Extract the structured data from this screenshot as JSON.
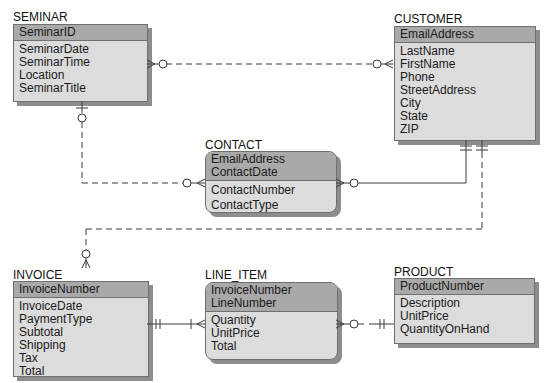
{
  "diagram": {
    "type": "entity-relationship (crow's foot, IE notation)",
    "entities": [
      {
        "name": "SEMINAR",
        "keys": [
          "SeminarID"
        ],
        "attributes": [
          "SeminarDate",
          "SeminarTime",
          "Location",
          "SeminarTitle"
        ]
      },
      {
        "name": "CUSTOMER",
        "keys": [
          "EmailAddress"
        ],
        "attributes": [
          "LastName",
          "FirstName",
          "Phone",
          "StreetAddress",
          "City",
          "State",
          "ZIP"
        ]
      },
      {
        "name": "CONTACT",
        "keys": [
          "EmailAddress",
          "ContactDate"
        ],
        "attributes": [
          "ContactNumber",
          "ContactType"
        ]
      },
      {
        "name": "INVOICE",
        "keys": [
          "InvoiceNumber"
        ],
        "attributes": [
          "InvoiceDate",
          "PaymentType",
          "Subtotal",
          "Shipping",
          "Tax",
          "Total"
        ]
      },
      {
        "name": "LINE_ITEM",
        "keys": [
          "InvoiceNumber",
          "LineNumber"
        ],
        "attributes": [
          "Quantity",
          "UnitPrice",
          "Total"
        ]
      },
      {
        "name": "PRODUCT",
        "keys": [
          "ProductNumber"
        ],
        "attributes": [
          "Description",
          "UnitPrice",
          "QuantityOnHand"
        ]
      }
    ],
    "relationships": [
      {
        "from": "SEMINAR",
        "to": "CUSTOMER",
        "line": "dashed",
        "from_end": "zero-or-many",
        "to_end": "zero-or-many"
      },
      {
        "from": "SEMINAR",
        "to": "CONTACT",
        "line": "dashed",
        "from_end": "zero-or-one",
        "to_end": "zero-or-many"
      },
      {
        "from": "CUSTOMER",
        "to": "CONTACT",
        "line": "solid",
        "from_end": "exactly-one",
        "to_end": "zero-or-many"
      },
      {
        "from": "CUSTOMER",
        "to": "INVOICE",
        "line": "dashed",
        "from_end": "exactly-one",
        "to_end": "zero-or-many"
      },
      {
        "from": "INVOICE",
        "to": "LINE_ITEM",
        "line": "solid",
        "from_end": "exactly-one",
        "to_end": "one-or-many"
      },
      {
        "from": "PRODUCT",
        "to": "LINE_ITEM",
        "line": "dashed",
        "from_end": "exactly-one",
        "to_end": "zero-or-many"
      }
    ]
  }
}
